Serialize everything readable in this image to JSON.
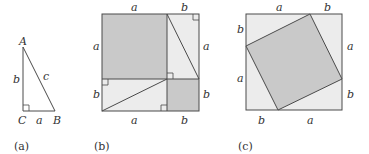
{
  "figures": {
    "a": {
      "caption": "(a)",
      "vertices": {
        "A": "A",
        "B": "B",
        "C": "C"
      },
      "sides": {
        "vertical": "b",
        "horizontal": "a",
        "hypotenuse": "c"
      }
    },
    "b": {
      "caption": "(b)",
      "top": [
        "a",
        "b"
      ],
      "bottom": [
        "a",
        "b"
      ],
      "left": [
        "a",
        "b"
      ],
      "right": [
        "a",
        "b"
      ]
    },
    "c": {
      "caption": "(c)",
      "top": [
        "a",
        "b"
      ],
      "bottom": [
        "b",
        "a"
      ],
      "left": [
        "b",
        "a"
      ],
      "right": [
        "a",
        "b"
      ]
    }
  },
  "colors": {
    "dark_fill": "#c9c9c9",
    "light_fill": "#ececec",
    "stroke": "#4a4a4a"
  }
}
